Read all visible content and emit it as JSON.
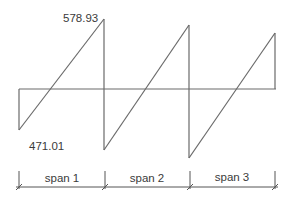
{
  "diagram": {
    "type": "shear-force-diagram",
    "annotations": {
      "max_value": "578.93",
      "min_value": "471.01"
    },
    "spans": [
      {
        "label": "span 1"
      },
      {
        "label": "span 2"
      },
      {
        "label": "span 3"
      }
    ],
    "colors": {
      "line": "#6a6a6a",
      "text": "#3a3a3a",
      "background": "#ffffff"
    }
  }
}
